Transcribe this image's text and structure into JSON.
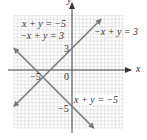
{
  "chart_data": {
    "type": "line",
    "title": "",
    "xlabel": "x",
    "ylabel": "y",
    "xlim": [
      -8,
      7
    ],
    "ylim": [
      -8,
      7.5
    ],
    "grid": true,
    "legend": {
      "position": "top-left",
      "entries": [
        "x + y = −5",
        "−x + y = 3"
      ]
    },
    "series": [
      {
        "name": "−x + y = 3",
        "equation": "y = x + 3",
        "x": [
          -8,
          4
        ],
        "y": [
          -5,
          7
        ],
        "y_intercept": 3,
        "arrows": "both"
      },
      {
        "name": "x + y = −5",
        "equation": "y = -x - 5",
        "x": [
          -8,
          3
        ],
        "y": [
          3,
          -8
        ],
        "y_intercept": -5,
        "arrows": "both"
      }
    ],
    "intersection": {
      "x": -4,
      "y": -1
    },
    "tick_labels": {
      "origin": "0",
      "x": [
        {
          "value": -5,
          "label": "−5"
        }
      ],
      "y": [
        {
          "value": 3,
          "label": "3"
        },
        {
          "value": -5,
          "label": "−5"
        }
      ]
    },
    "annotations": [
      {
        "text": "x + y = −5",
        "position": "top-left"
      },
      {
        "text": "−x + y = 3",
        "position": "top-left"
      },
      {
        "text": "−x + y = 3",
        "position": "right of line end"
      },
      {
        "text": "x + y = −5",
        "position": "lower-right near y-intercept"
      }
    ],
    "colors": {
      "lines": "#7a7a7a",
      "axes": "#444444",
      "grid": "#d6d6d6",
      "text": "#333333"
    }
  },
  "labels": {
    "legend_line1": "x + y = −5",
    "legend_line2": "−x + y = 3",
    "line_a_label": "−x + y = 3",
    "line_b_label": "x + y = −5",
    "x_axis": "x",
    "y_axis": "y",
    "origin": "0",
    "x_tick_neg5": "−5",
    "y_tick_3": "3",
    "y_tick_neg5": "−5"
  }
}
